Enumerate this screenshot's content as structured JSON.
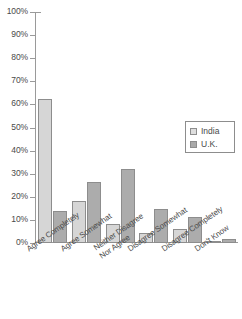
{
  "chart_data": {
    "type": "bar",
    "title": "",
    "xlabel": "",
    "ylabel": "",
    "ylim": [
      0,
      100
    ],
    "grid": false,
    "legend_position": "right-middle",
    "categories": [
      "Agree Completely",
      "Agree Somewhat",
      "Neither Disagree Nor Agree",
      "Disagree Somewhat",
      "Disagree Completely",
      "Don't Know"
    ],
    "category_lines": [
      [
        "Agree Completely",
        ""
      ],
      [
        "Agree Somewhat",
        ""
      ],
      [
        "Neither Disagree",
        "Nor Agree"
      ],
      [
        "Disagree Somewhat",
        ""
      ],
      [
        "Disagree Completely",
        ""
      ],
      [
        "Don't Know",
        ""
      ]
    ],
    "series": [
      {
        "name": "India",
        "color": "#d6d6d6",
        "values": [
          62.3,
          18.2,
          8.2,
          4.3,
          6.0,
          0.4
        ]
      },
      {
        "name": "U.K.",
        "color": "#acacac",
        "values": [
          13.9,
          26.4,
          32.0,
          14.7,
          11.4,
          1.6
        ]
      }
    ],
    "y_ticks": [
      "0%",
      "10%",
      "20%",
      "30%",
      "40%",
      "50%",
      "60%",
      "70%",
      "80%",
      "90%",
      "100%"
    ],
    "y_tick_values": [
      0,
      10,
      20,
      30,
      40,
      50,
      60,
      70,
      80,
      90,
      100
    ]
  },
  "legend": {
    "items": [
      {
        "label": "India",
        "color": "#d6d6d6"
      },
      {
        "label": "U.K.",
        "color": "#acacac"
      }
    ]
  }
}
